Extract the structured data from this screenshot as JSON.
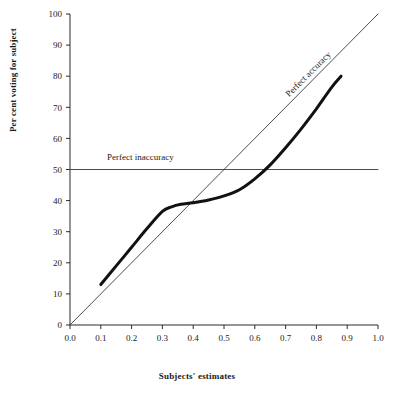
{
  "chart_data": {
    "type": "line",
    "title": "",
    "xlabel": "Subjects' estimates",
    "ylabel": "Per cent voting for subject",
    "xlim": [
      0.0,
      1.0
    ],
    "ylim": [
      0,
      100
    ],
    "grid": false,
    "legend_position": "inline-annotations",
    "xticks": [
      "0.0",
      "0.1",
      "0.2",
      "0.3",
      "0.4",
      "0.5",
      "0.6",
      "0.7",
      "0.8",
      "0.9",
      "1.0"
    ],
    "xtick_values": [
      0.0,
      0.1,
      0.2,
      0.3,
      0.4,
      0.5,
      0.6,
      0.7,
      0.8,
      0.9,
      1.0
    ],
    "yticks": [
      "0",
      "10",
      "20",
      "30",
      "40",
      "50",
      "60",
      "70",
      "80",
      "90",
      "100"
    ],
    "ytick_values": [
      0,
      10,
      20,
      30,
      40,
      50,
      60,
      70,
      80,
      90,
      100
    ],
    "annotations": [
      {
        "text": "Perfect accuracy",
        "x": 0.78,
        "y": 80,
        "rotation": -45
      },
      {
        "text": "Perfect inaccuracy",
        "x": 0.12,
        "y": 53,
        "rotation": 0
      }
    ],
    "series": [
      {
        "name": "Perfect accuracy",
        "type": "line",
        "style": "thin",
        "color": "#3a3a3a",
        "x": [
          0.0,
          1.0
        ],
        "values": [
          0,
          100
        ]
      },
      {
        "name": "Perfect inaccuracy",
        "type": "line",
        "style": "thin",
        "color": "#3a3a3a",
        "x": [
          0.0,
          1.0
        ],
        "values": [
          50,
          50
        ]
      },
      {
        "name": "Observed voting curve",
        "type": "line",
        "style": "thick",
        "color": "#111111",
        "x": [
          0.1,
          0.15,
          0.2,
          0.25,
          0.3,
          0.33,
          0.36,
          0.4,
          0.45,
          0.5,
          0.55,
          0.6,
          0.65,
          0.7,
          0.75,
          0.8,
          0.85,
          0.88
        ],
        "values": [
          13.0,
          19.0,
          25.0,
          31.0,
          36.5,
          38.0,
          38.8,
          39.3,
          40.2,
          41.5,
          43.5,
          47.0,
          51.5,
          57.0,
          63.0,
          69.5,
          76.5,
          80.0
        ]
      }
    ]
  }
}
